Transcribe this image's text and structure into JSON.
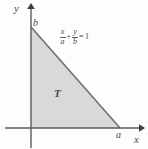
{
  "figure": {
    "background_color": "#fdfdfd",
    "axis_color": "#5a5a5a",
    "region_fill_color": "#d9d9d9",
    "region_edge_color": "#6e6e6e",
    "label_color": "#4a4a4a"
  },
  "axes": {
    "y_axis_label": "y",
    "x_axis_label": "x",
    "origin": {
      "x": 31,
      "y": 128
    },
    "x_axis_start": {
      "x": 5,
      "y": 128
    },
    "x_axis_end": {
      "x": 143,
      "y": 128
    },
    "y_axis_top": {
      "x": 31,
      "y": 5
    },
    "y_axis_bottom": {
      "x": 31,
      "y": 148
    }
  },
  "region": {
    "name": "T",
    "label": "T",
    "label_position": {
      "x": 54,
      "y": 88
    },
    "vertices": [
      {
        "x": 31,
        "y": 128
      },
      {
        "x": 31,
        "y": 27
      },
      {
        "x": 120,
        "y": 128
      }
    ]
  },
  "intercepts": {
    "y_intercept_label": "b",
    "y_intercept_position": {
      "x": 33,
      "y": 18
    },
    "x_intercept_label": "a",
    "x_intercept_position": {
      "x": 116,
      "y": 130
    }
  },
  "equation": {
    "text": "x/a + y/b = 1",
    "term1_numerator": "x",
    "term1_denominator": "a",
    "operator": "+",
    "term2_numerator": "y",
    "term2_denominator": "b",
    "relation": "=",
    "right_side": "1",
    "position": {
      "x": 59,
      "y": 28
    }
  }
}
